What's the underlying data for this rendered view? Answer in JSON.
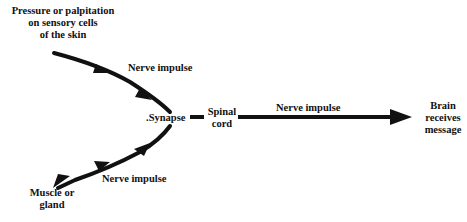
{
  "diagram": {
    "nodes": {
      "stimulus": {
        "line1": "Pressure or palpitation",
        "line2": "on sensory cells",
        "line3": "of the skin"
      },
      "synapse": {
        "label": ".Synapse"
      },
      "spinal_cord": {
        "line1": "Spinal",
        "line2": "cord"
      },
      "brain": {
        "line1": "Brain",
        "line2": "receives",
        "line3": "message"
      },
      "effector": {
        "line1": "Muscle or",
        "line2": "gland"
      }
    },
    "edges": [
      {
        "from": "stimulus",
        "to": "synapse",
        "label": "Nerve impulse"
      },
      {
        "from": "spinal_cord",
        "to": "brain",
        "label": "Nerve impulse"
      },
      {
        "from": "synapse",
        "to": "effector",
        "label": "Nerve impulse"
      }
    ],
    "colors": {
      "stroke": "#111111",
      "background": "#ffffff"
    }
  }
}
